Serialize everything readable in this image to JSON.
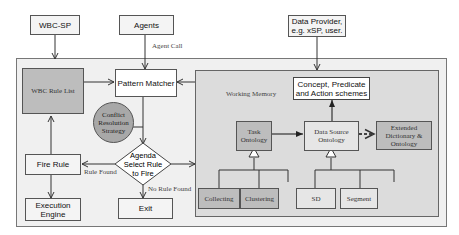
{
  "diagram": {
    "external": {
      "wbc_sp": "WBC-SP",
      "agents": "Agents",
      "data_provider_line1": "Data Provider,",
      "data_provider_line2": "e.g. xSP, user."
    },
    "edge_labels": {
      "agent_call": "Agent Call",
      "rule_found": "Rule Found",
      "no_rule_found": "No Rule Found"
    },
    "engine": {
      "wbc_rule_list": "WBC Rule List",
      "pattern_matcher": "Pattern Matcher",
      "conflict_line1": "Conflict",
      "conflict_line2": "Resolution",
      "conflict_line3": "Strategy",
      "agenda_line1": "Agenda",
      "agenda_line2": "Select Rule",
      "agenda_line3": "to Fire",
      "fire_rule": "Fire Rule",
      "execution_line1": "Execution",
      "execution_line2": "Engine",
      "exit": "Exit"
    },
    "working_memory": {
      "title": "Working Memory",
      "schemes_line1": "Concept, Predicate",
      "schemes_line2": "and Action schemes",
      "task_line1": "Task",
      "task_line2": "Ontology",
      "datasource_line1": "Data Source",
      "datasource_line2": "Ontology",
      "extended_line1": "Extended",
      "extended_line2": "Dictionary &",
      "extended_line3": "Ontology",
      "collecting": "Collecting",
      "clustering": "Clustering",
      "sd": "SD",
      "segment": "Segment"
    }
  }
}
